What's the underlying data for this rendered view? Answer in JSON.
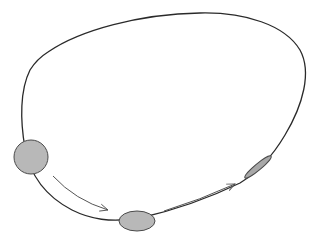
{
  "diagram": {
    "colors": {
      "background": "#ffffff",
      "curve": "#2a2a2a",
      "blob_fill": "#b8b8b8",
      "blob_stroke": "#4a4a4a",
      "arrow": "#555555"
    },
    "blobs": [
      {
        "name": "circle",
        "shape": "circle",
        "stage": 1
      },
      {
        "name": "ellipse",
        "shape": "ellipse",
        "stage": 2
      },
      {
        "name": "thin-ellipse",
        "shape": "thin-ellipse",
        "stage": 3
      }
    ],
    "arrows": [
      {
        "name": "arrow-1",
        "from": "circle",
        "to": "ellipse"
      },
      {
        "name": "arrow-2",
        "from": "ellipse",
        "to": "thin-ellipse"
      }
    ]
  }
}
